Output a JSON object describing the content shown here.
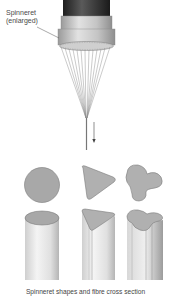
{
  "diagram": {
    "spinneret_label_line1": "Spinneret",
    "spinneret_label_line2": "(enlarged)",
    "caption": "Spinneret shapes and fibre cross section",
    "cross_sections": [
      {
        "shape": "round",
        "label": "round-cross-section"
      },
      {
        "shape": "triangular",
        "label": "triangular-cross-section"
      },
      {
        "shape": "trilobal",
        "label": "trilobal-cross-section"
      }
    ],
    "colors": {
      "cap_dark": "#2a2a2a",
      "body_gray": "#b8b8b8",
      "shape_fill": "#a8a8a8",
      "fibre_light": "#e6e6e6"
    }
  }
}
